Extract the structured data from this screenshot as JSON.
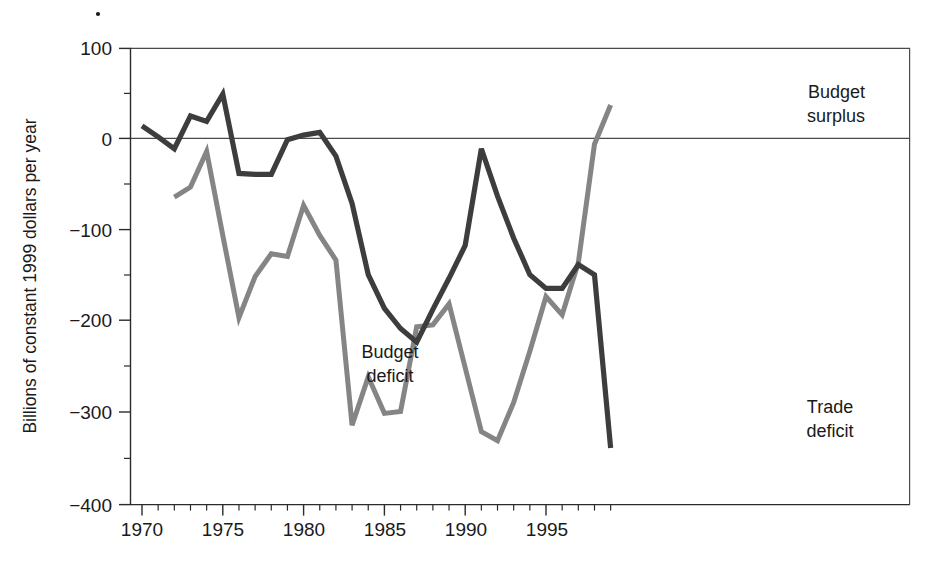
{
  "figure": {
    "background_color": "#ffffff",
    "speck_mark": "·"
  },
  "chart_data": {
    "type": "line",
    "title": "",
    "xlabel": "",
    "ylabel": "Billions of constant 1999 dollars per year",
    "xlim": [
      1969.2,
      1999.2
    ],
    "ylim": [
      -400,
      100
    ],
    "grid": false,
    "legend_position": "inline-annotations",
    "x_ticks_major": [
      1970,
      1975,
      1980,
      1985,
      1990,
      1995
    ],
    "x_tick_labels": [
      "1970",
      "1975",
      "1980",
      "1985",
      "1990",
      "1995"
    ],
    "x_ticks_minor_step": 1,
    "y_ticks_major": [
      100,
      0,
      -100,
      -200,
      -300,
      -400
    ],
    "y_tick_labels": [
      "100",
      "0",
      "−100",
      "−200",
      "−300",
      "−400"
    ],
    "y_ticks_minor": [
      50,
      -50,
      -150,
      -250,
      -350
    ],
    "zero_reference_line": 0,
    "series": [
      {
        "name": "Trade deficit",
        "color": "#3d3d3d",
        "stroke_width": 5.2,
        "label": "Trade deficit",
        "label_x": 1995.0,
        "label_y": -300,
        "x": [
          1970,
          1971,
          1972,
          1973,
          1974,
          1975,
          1976,
          1977,
          1978,
          1979,
          1980,
          1981,
          1982,
          1983,
          1984,
          1985,
          1986,
          1987,
          1988,
          1989,
          1990,
          1991,
          1992,
          1993,
          1994,
          1995,
          1996,
          1997,
          1998,
          1999
        ],
        "values": [
          15,
          3,
          -10,
          26,
          20,
          50,
          -37,
          -38,
          -38,
          0,
          5,
          8,
          -18,
          -70,
          -148,
          -185,
          -207,
          -222,
          -186,
          -152,
          -116,
          -10,
          -62,
          -108,
          -148,
          -163,
          -163,
          -137,
          -148,
          -338
        ]
      },
      {
        "name": "Budget deficit / surplus",
        "color": "#858585",
        "stroke_width": 5.0,
        "label": "Budget deficit",
        "label_x": 1983.4,
        "label_y": -232,
        "label_secondary": "Budget surplus",
        "label_secondary_x": 1996.3,
        "label_secondary_y": 62,
        "x": [
          1972,
          1973,
          1974,
          1975,
          1976,
          1977,
          1978,
          1979,
          1980,
          1981,
          1982,
          1983,
          1984,
          1985,
          1986,
          1987,
          1988,
          1989,
          1990,
          1991,
          1992,
          1993,
          1994,
          1995,
          1996,
          1997,
          1998,
          1999
        ],
        "values": [
          -63,
          -52,
          -13,
          -105,
          -195,
          -150,
          -125,
          -128,
          -72,
          -105,
          -132,
          -313,
          -260,
          -300,
          -298,
          -205,
          -203,
          -180,
          -250,
          -320,
          -330,
          -288,
          -232,
          -172,
          -192,
          -135,
          -5,
          38
        ]
      }
    ],
    "annotations": [
      {
        "text": "Budget surplus",
        "lines": [
          "Budget",
          "surplus"
        ],
        "x": 1996.3,
        "y": 62,
        "target_series": "Budget deficit / surplus"
      },
      {
        "text": "Budget deficit",
        "lines": [
          "Budget",
          "deficit"
        ],
        "x": 1983.4,
        "y": -232,
        "target_series": "Budget deficit / surplus"
      },
      {
        "text": "Trade deficit",
        "lines": [
          "Trade",
          "deficit"
        ],
        "x": 1995.0,
        "y": -300,
        "target_series": "Trade deficit"
      }
    ]
  }
}
